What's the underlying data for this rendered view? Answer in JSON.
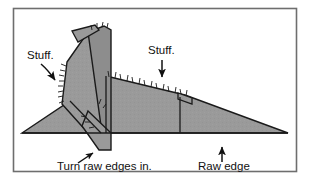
{
  "figure": {
    "frame": {
      "border_color": "#6e6e6e",
      "background_color": "#ffffff",
      "x": 13,
      "y": 8,
      "width": 284,
      "height": 164
    },
    "shape": {
      "fill_color": "#9a9a9a",
      "stroke_color": "#1a1a1a",
      "raw_edge_fringe": true
    },
    "annotations": [
      {
        "id": "stuff-left",
        "label": "Stuff.",
        "text_x": 27,
        "text_y": 59,
        "arrow": {
          "x1": 41,
          "y1": 63,
          "x2": 57,
          "y2": 82,
          "style": "curved-down-right"
        }
      },
      {
        "id": "stuff-right",
        "label": "Stuff.",
        "text_x": 148,
        "text_y": 54,
        "arrow": {
          "x1": 162,
          "y1": 59,
          "x2": 162,
          "y2": 79,
          "style": "straight-down"
        }
      },
      {
        "id": "turn-raw-edges-in",
        "label": "Turn raw edges in.",
        "text_x": 57,
        "text_y": 170,
        "arrow": {
          "x1": 79,
          "y1": 163,
          "x2": 95,
          "y2": 152,
          "style": "short-up-right"
        }
      },
      {
        "id": "raw-edge",
        "label": "Raw edge",
        "text_x": 198,
        "text_y": 170,
        "arrow": {
          "x1": 222,
          "y1": 162,
          "x2": 222,
          "y2": 145,
          "style": "straight-up"
        }
      }
    ]
  },
  "colors": {
    "fabric_grey": "#9a9a9a",
    "fabric_grey_dark": "#8d8d8d",
    "outline": "#1a1a1a",
    "frame": "#6e6e6e",
    "text": "#111111",
    "page": "#ffffff"
  }
}
